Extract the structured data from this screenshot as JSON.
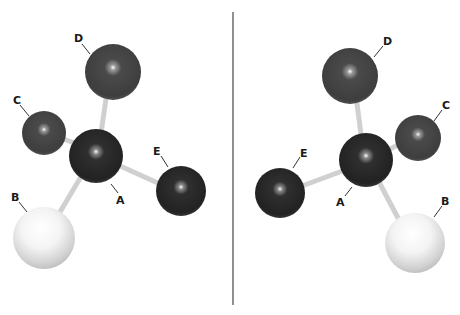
{
  "figure": {
    "divider": {
      "x": 233,
      "y1": 12,
      "y2": 305,
      "color": "#555555"
    },
    "colors": {
      "central_atom": "#2a2a2a",
      "dark_atom": "#2e2e2e",
      "gray_atom": "#4a4a4a",
      "light_atom": "#f2f2f2",
      "bond": "#d8d8d8"
    },
    "left_molecule": {
      "labels": {
        "A": "A",
        "B": "B",
        "C": "C",
        "D": "D",
        "E": "E"
      }
    },
    "right_molecule": {
      "labels": {
        "A": "A",
        "B": "B",
        "C": "C",
        "D": "D",
        "E": "E"
      }
    }
  }
}
